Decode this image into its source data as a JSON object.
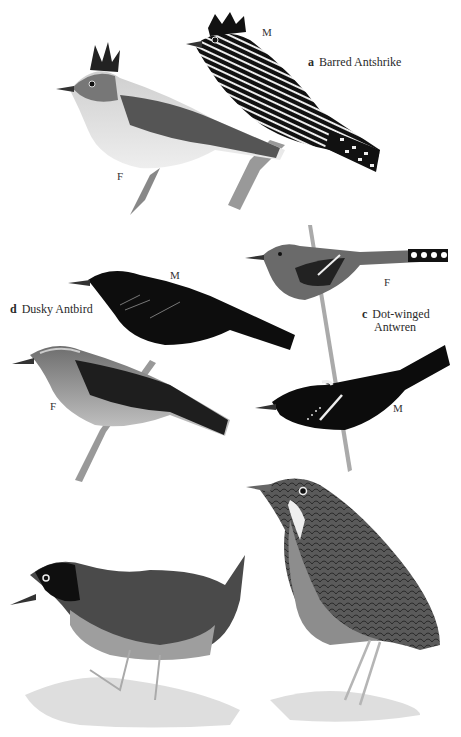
{
  "plate": {
    "species": [
      {
        "letter": "a",
        "name": "Barred Antshrike",
        "figures": [
          {
            "sex": "M"
          },
          {
            "sex": "F"
          }
        ]
      },
      {
        "letter": "c",
        "name_line1": "Dot-winged",
        "name_line2": "Antwren",
        "figures": [
          {
            "sex": "F"
          },
          {
            "sex": "M"
          }
        ]
      },
      {
        "letter": "d",
        "name": "Dusky Antbird",
        "figures": [
          {
            "sex": "M"
          },
          {
            "sex": "F"
          }
        ]
      }
    ],
    "unlabeled_figures": [
      {
        "description": "ground-dwelling antthrush, dark head, grey underparts, cocked tail"
      },
      {
        "description": "antpitta, scalloped back, pale throat patch, long legs"
      }
    ]
  },
  "colors": {
    "background": "#ffffff",
    "ink_dark": "#111111",
    "grey_mid": "#6b6b6b",
    "grey_light": "#bdbdbd"
  }
}
